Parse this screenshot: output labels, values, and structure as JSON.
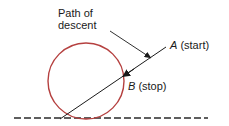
{
  "diagram": {
    "labels": {
      "path_line1": "Path of",
      "path_line2": "descent",
      "a_var": "A",
      "a_text": " (start)",
      "b_var": "B",
      "b_text": " (stop)"
    },
    "colors": {
      "circle": "#b5403f",
      "line": "#1a1a1a",
      "ground": "#2a2a2a",
      "text": "#1a1a1a"
    },
    "shapes": {
      "circle": {
        "cx": 86,
        "cy": 81,
        "r": 38
      },
      "descent_line": {
        "x1": 166,
        "y1": 47,
        "x2": 60,
        "y2": 119
      },
      "arrow_at_b": {
        "x": 124,
        "y": 76
      },
      "leader_line": {
        "x1": 110,
        "y1": 31,
        "x2": 151,
        "y2": 58
      },
      "ground_line": {
        "x1": 14,
        "y1": 118,
        "x2": 208,
        "y2": 118,
        "dash": "7 3"
      }
    }
  }
}
